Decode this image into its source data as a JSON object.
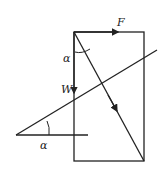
{
  "diagram": {
    "labels": {
      "force": "F",
      "weight": "W",
      "angle_top": "α",
      "angle_bottom": "α"
    },
    "colors": {
      "stroke": "#222222",
      "background": "#ffffff"
    }
  }
}
